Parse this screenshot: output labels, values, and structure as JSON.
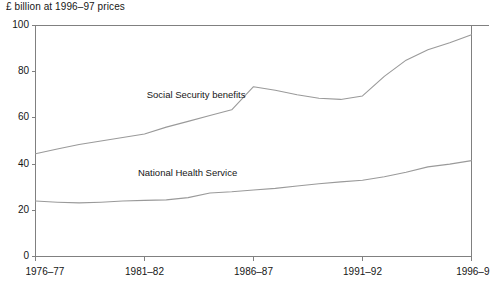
{
  "chart_data": {
    "type": "line",
    "title": "",
    "subtitle": "",
    "ylabel": "£ billion at 1996–97 prices",
    "xlabel": "",
    "ylim": [
      0,
      100
    ],
    "yticks": [
      0,
      20,
      40,
      60,
      80,
      100
    ],
    "ytick_labels": [
      "0",
      "20",
      "40",
      "60",
      "80",
      "100"
    ],
    "xtick_labels": [
      "1976–77",
      "1981–82",
      "1986–87",
      "1991–92",
      "1996–9"
    ],
    "x": [
      "1976–77",
      "1977–78",
      "1978–79",
      "1979–80",
      "1980–81",
      "1981–82",
      "1982–83",
      "1983–84",
      "1984–85",
      "1985–86",
      "1986–87",
      "1987–88",
      "1988–89",
      "1989–90",
      "1990–91",
      "1991–92",
      "1992–93",
      "1993–94",
      "1994–95",
      "1995–96",
      "1996–97"
    ],
    "grid": false,
    "legend_position": "inline-annotation",
    "series": [
      {
        "name": "Social Security benefits",
        "color": "#9a9a9a",
        "label_x_frac": 0.255,
        "label_y_value": 70,
        "values": [
          44.5,
          46.5,
          48.5,
          50.0,
          51.5,
          53.0,
          56.0,
          58.5,
          61.0,
          63.5,
          73.5,
          72.0,
          70.0,
          68.5,
          68.0,
          69.5,
          78.0,
          85.0,
          89.5,
          92.5,
          96.0
        ]
      },
      {
        "name": "National Health Service",
        "color": "#9a9a9a",
        "label_x_frac": 0.235,
        "label_y_value": 36,
        "values": [
          24.0,
          23.5,
          23.2,
          23.5,
          24.0,
          24.3,
          24.5,
          25.5,
          27.5,
          28.0,
          28.8,
          29.5,
          30.5,
          31.5,
          32.3,
          33.0,
          34.5,
          36.5,
          38.8,
          40.0,
          41.5
        ]
      }
    ]
  },
  "series_labels": {
    "social_security": "Social Security benefits",
    "nhs": "National Health Service"
  }
}
